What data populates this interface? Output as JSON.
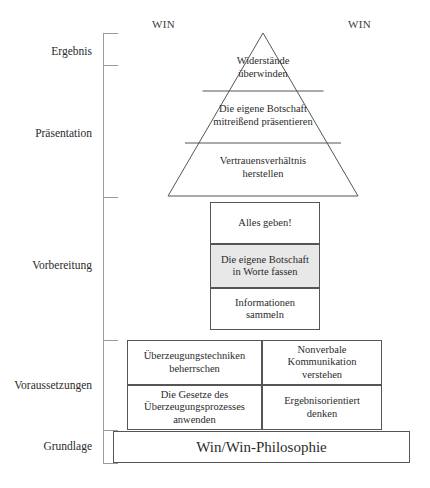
{
  "diagram": {
    "win_labels": {
      "left": "WIN",
      "right": "WIN"
    },
    "phases": [
      {
        "id": "ergebnis",
        "label": "Ergebnis",
        "top": 45
      },
      {
        "id": "praesentation",
        "label": "Präsentation",
        "top": 127
      },
      {
        "id": "vorbereitung",
        "label": "Vorbereitung",
        "top": 259
      },
      {
        "id": "voraussetzungen",
        "label": "Voraussetzungen",
        "top": 379
      },
      {
        "id": "grundlage",
        "label": "Grundlage",
        "top": 440
      }
    ],
    "axis": {
      "ticks": [
        33,
        65,
        197,
        340,
        430,
        463
      ],
      "color": "#9a9a9a"
    },
    "pyramid": {
      "tiers": [
        {
          "id": "tier-top",
          "line1": "Widerstände",
          "line2": "überwinden"
        },
        {
          "id": "tier-middle",
          "line1": "Die eigene Botschaft",
          "line2": "mitreißend präsentieren"
        },
        {
          "id": "tier-bottom",
          "line1": "Vertrauensverhältnis",
          "line2": "herstellen"
        }
      ]
    },
    "preparation": {
      "boxes": [
        {
          "id": "alles-geben",
          "line1": "Alles geben!",
          "line2": "",
          "shaded": false
        },
        {
          "id": "botschaft-worte",
          "line1": "Die eigene Botschaft",
          "line2": "in Worte fassen",
          "shaded": true
        },
        {
          "id": "informationen",
          "line1": "Informationen",
          "line2": "sammeln",
          "shaded": false
        }
      ],
      "shade_color": "#e8e8e8"
    },
    "prerequisites": {
      "cells": [
        {
          "id": "ueberzeugungstechniken",
          "line1": "Überzeugungstechniken",
          "line2": "beherrschen",
          "line3": ""
        },
        {
          "id": "nonverbale",
          "line1": "Nonverbale",
          "line2": "Kommunikation",
          "line3": "verstehen"
        },
        {
          "id": "gesetze",
          "line1": "Die Gesetze des",
          "line2": "Überzeugungsprozesses",
          "line3": "anwenden"
        },
        {
          "id": "ergebnisorientiert",
          "line1": "Ergebnisorientiert",
          "line2": "denken",
          "line3": ""
        }
      ]
    },
    "base": {
      "label": "Win/Win-Philosophie"
    },
    "colors": {
      "stroke": "#555555",
      "axis": "#9a9a9a",
      "text": "#2b2b2b",
      "shade": "#e8e8e8",
      "background": "#ffffff"
    }
  }
}
